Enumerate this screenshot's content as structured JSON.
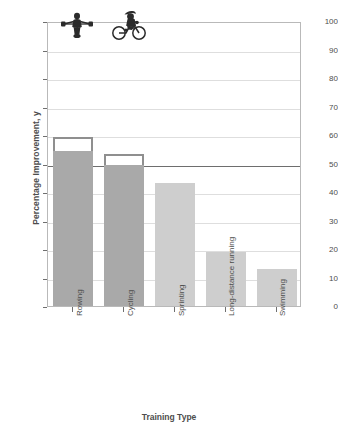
{
  "chart_data": {
    "type": "bar",
    "title": "",
    "xlabel": "Training Type",
    "ylabel": "Percentage Improvement, y",
    "categories": [
      "Rowing",
      "Cycling",
      "Sprinting",
      "Long-distance running",
      "Swimming"
    ],
    "values": [
      60,
      54,
      43,
      19,
      13
    ],
    "solid_fill_values": [
      55,
      50,
      43,
      19,
      13
    ],
    "ylim": [
      0,
      100
    ],
    "yticks": [
      0,
      10,
      20,
      30,
      40,
      50,
      60,
      70,
      80,
      90,
      100
    ],
    "ytick_labels": [
      "0",
      "10",
      "20",
      "30",
      "40",
      "50",
      "60",
      "70",
      "80",
      "90",
      "100"
    ],
    "grid": true,
    "legend": "none",
    "reference_line": {
      "value": 50,
      "color": "#6e6e6e"
    },
    "series": [
      {
        "name": "Percentage Improvement",
        "values": [
          60,
          54,
          43,
          19,
          13
        ],
        "colors": [
          "#a9a9a9",
          "#a9a9a9",
          "#cecece",
          "#cecece",
          "#cecece"
        ]
      }
    ],
    "annotations": [
      {
        "category": "Rowing",
        "icon": "rower-pictogram"
      },
      {
        "category": "Cycling",
        "icon": "cyclist-pictogram"
      }
    ],
    "colors": {
      "bar_dark": "#a9a9a9",
      "bar_light": "#cecece",
      "bar_outline": "#8f8f8f",
      "grid": "#dedede",
      "frame": "#b9b9b9",
      "text": "#4d4d4d",
      "reference_line": "#6e6e6e",
      "background": "#ffffff"
    }
  }
}
